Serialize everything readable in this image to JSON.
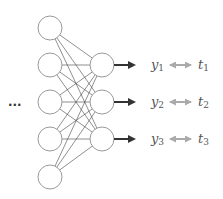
{
  "diagram": {
    "ellipsis": "...",
    "input_layer": {
      "count": 5,
      "x": 50,
      "ys": [
        28,
        65,
        102,
        139,
        177
      ],
      "r": 12
    },
    "output_layer": {
      "count": 3,
      "x": 102,
      "ys": [
        65,
        102,
        139
      ],
      "r": 12
    },
    "outputs": [
      {
        "y": "y",
        "y_sub": "1",
        "t": "t",
        "t_sub": "1"
      },
      {
        "y": "y",
        "y_sub": "2",
        "t": "t",
        "t_sub": "2"
      },
      {
        "y": "y",
        "y_sub": "3",
        "t": "t",
        "t_sub": "3"
      }
    ],
    "colors": {
      "node_stroke": "#999999",
      "edge": "#444444",
      "arrow": "#333333",
      "compare_arrow": "#aaaaaa"
    }
  }
}
